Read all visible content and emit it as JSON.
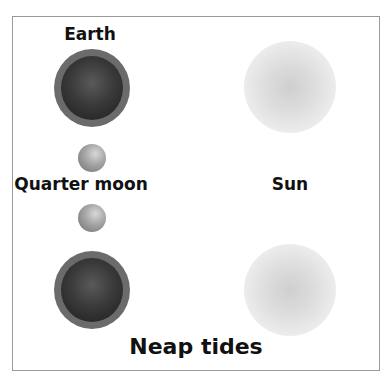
{
  "diagram": {
    "title": "Neap tides",
    "labels": {
      "earth": "Earth",
      "quarter_moon": "Quarter moon",
      "sun": "Sun"
    },
    "bodies": [
      {
        "name": "earth-top",
        "type": "earth",
        "cx": 92,
        "cy": 88
      },
      {
        "name": "moon-top",
        "type": "moon",
        "cx": 92,
        "cy": 158
      },
      {
        "name": "moon-bottom",
        "type": "moon",
        "cx": 92,
        "cy": 218
      },
      {
        "name": "earth-bottom",
        "type": "earth",
        "cx": 92,
        "cy": 290
      },
      {
        "name": "sun-top",
        "type": "sun",
        "cx": 290,
        "cy": 87
      },
      {
        "name": "sun-bottom",
        "type": "sun",
        "cx": 290,
        "cy": 290
      }
    ],
    "colors": {
      "earth_ring": "#6b6b6b",
      "earth_core": "#2a2a2a",
      "moon": "#a8a8a8",
      "sun": "#d0d0d0",
      "border": "#9a9a9a",
      "text": "#111111"
    }
  }
}
